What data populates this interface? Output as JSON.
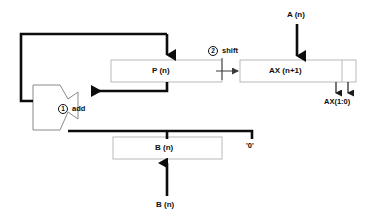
{
  "diagram": {
    "type": "datapath-block-diagram",
    "colors": {
      "wire": "#0d0d0d",
      "box_border": "#b8b8b8",
      "box_fill": "#ffffff",
      "text": "#0d0d0d",
      "thin_wire": "#3a3a3a",
      "background": "#ffffff"
    },
    "blocks": [
      {
        "name": "p-register",
        "label": "P (n)",
        "x": 111,
        "y": 60,
        "width": 111,
        "height": 22
      },
      {
        "name": "ax-register",
        "label": "AX (n+1)",
        "x": 240,
        "y": 60,
        "width": 116,
        "height": 22,
        "divider_x": 342
      },
      {
        "name": "b-register",
        "label": "B (n)",
        "x": 113,
        "y": 137,
        "width": 109,
        "height": 22
      }
    ],
    "alu": {
      "name": "adder-alu",
      "label": "add",
      "step": "1",
      "step_label": "add"
    },
    "steps": [
      {
        "number": "1",
        "label": "add"
      },
      {
        "number": "2",
        "label": "shift"
      }
    ],
    "io_labels": [
      {
        "name": "a-input-label",
        "text": "A (n)",
        "x": 287,
        "y": 11
      },
      {
        "name": "b-input-label",
        "text": "B (n)",
        "x": 156,
        "y": 201
      },
      {
        "name": "ax-low-bits-label",
        "text": "AX(1:0)",
        "x": 324,
        "y": 99
      },
      {
        "name": "zero-constant-label",
        "text": "'0'",
        "x": 246,
        "y": 143
      }
    ],
    "annotations": [
      {
        "name": "step-shift-label",
        "text": "shift",
        "x": 221,
        "y": 48
      },
      {
        "name": "step-add-label",
        "text": "add",
        "x": 71,
        "y": 105
      }
    ]
  }
}
